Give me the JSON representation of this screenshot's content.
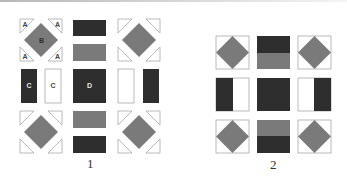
{
  "colors": {
    "dark": "#2e2e2e",
    "gray": "#7a7a7a",
    "outline": "#a8a8a8",
    "white": "#ffffff",
    "letter_on_light": "#444444",
    "letter_on_dark": "#e6e6e6"
  },
  "panels": [
    {
      "caption": "1",
      "labels": {
        "corner_triangle": "A",
        "diamond": "B",
        "side_rect": "C",
        "center_square": "D"
      }
    },
    {
      "caption": "2"
    }
  ]
}
